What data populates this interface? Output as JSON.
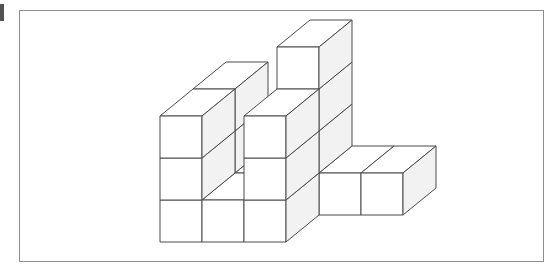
{
  "figure": {
    "kind": "isometric-unit-cube-stack",
    "page_mark": "",
    "frame": {
      "x": 19,
      "y": 10,
      "width": 525,
      "height": 252,
      "border_color": "#8d8d8d"
    },
    "colors": {
      "background": "#ffffff",
      "outline": "#4a4a4a",
      "top_face": "#ffffff",
      "front_face": "#ffffff",
      "side_face": "#f2f2f2"
    },
    "projection": {
      "origin_x": 160,
      "origin_y": 242,
      "cube_width": 42,
      "cube_height": 42,
      "depth_dx": 33,
      "depth_dy": -27,
      "grid_cols": 3,
      "grid_rows": 2,
      "grid_levels": 3
    },
    "cube_count": 16,
    "voxels": [
      [
        0,
        0,
        0
      ],
      [
        1,
        0,
        0
      ],
      [
        2,
        0,
        0
      ],
      [
        0,
        1,
        0
      ],
      [
        1,
        1,
        0
      ],
      [
        2,
        1,
        0
      ],
      [
        3,
        1,
        0
      ],
      [
        4,
        1,
        0
      ],
      [
        0,
        0,
        1
      ],
      [
        2,
        0,
        1
      ],
      [
        0,
        1,
        1
      ],
      [
        2,
        1,
        1
      ],
      [
        0,
        0,
        2
      ],
      [
        2,
        0,
        2
      ],
      [
        0,
        1,
        2
      ],
      [
        2,
        1,
        2
      ],
      [
        2,
        1,
        3
      ]
    ]
  }
}
